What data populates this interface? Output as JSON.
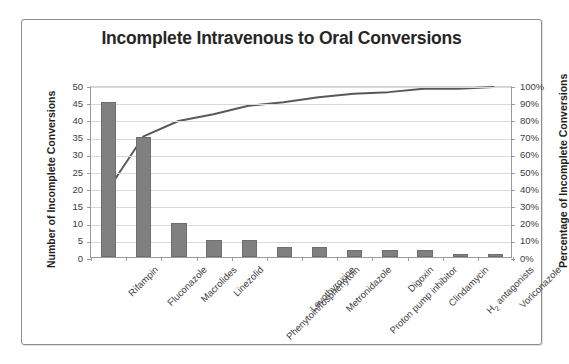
{
  "chart_data": {
    "type": "bar",
    "title": "Incomplete Intravenous to Oral Conversions",
    "xlabel": "",
    "ylabel": "Number of Incomplete Conversions",
    "y2label": "Percentage of Incomplete Conversions",
    "ylim": [
      0,
      50
    ],
    "y2lim": [
      0,
      100
    ],
    "yticks": [
      0,
      5,
      10,
      15,
      20,
      25,
      30,
      35,
      40,
      45,
      50
    ],
    "y2ticks": [
      "0%",
      "10%",
      "20%",
      "30%",
      "40%",
      "50%",
      "60%",
      "70%",
      "80%",
      "90%",
      "100%"
    ],
    "grid": true,
    "legend": "none",
    "categories": [
      "Rifampin",
      "Fluconazole",
      "Macrolides",
      "Linezolid",
      "Phenytoin/fosphenytoin",
      "Levothyroxine",
      "Metronidazole",
      "Proton pump inhibitor",
      "Digoxin",
      "Clindamycin",
      "H2 antagonists",
      "Voriconazole"
    ],
    "series": [
      {
        "name": "Number of Incomplete Conversions",
        "type": "bar",
        "axis": "left",
        "color": "#808080",
        "values": [
          45,
          35,
          10,
          5,
          5,
          3,
          3,
          2,
          2,
          2,
          1,
          1
        ]
      },
      {
        "name": "Cumulative Percentage of Incomplete Conversions",
        "type": "line",
        "axis": "right",
        "color": "#595959",
        "values": [
          40,
          71,
          80,
          84,
          89,
          91,
          94,
          96,
          97,
          99,
          99,
          100
        ]
      }
    ],
    "bar_colors": {
      "fill": "#808080",
      "border": "#6e6e6e"
    },
    "axis_colors": {
      "gridline": "#d9d9d9",
      "axis": "#9a9a9a",
      "text": "#3d3d3d",
      "title": "#262626"
    },
    "total_conversions": 114
  }
}
